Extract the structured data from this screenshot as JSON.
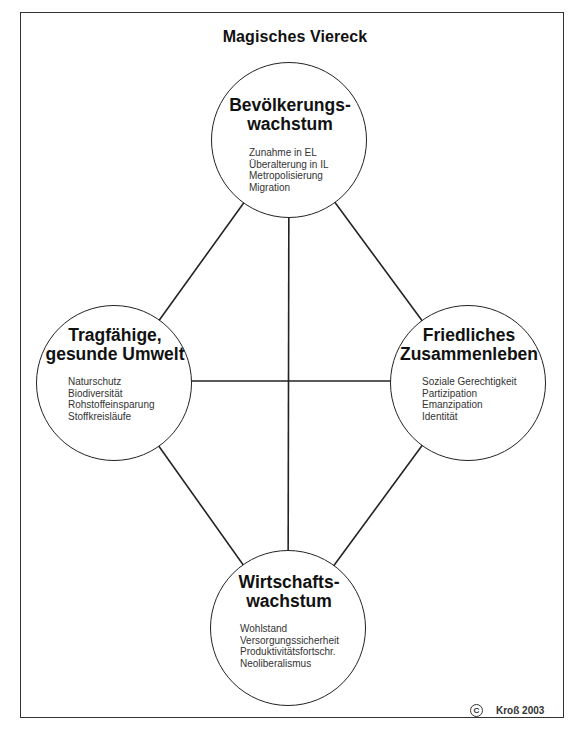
{
  "title": "Magisches Viereck",
  "nodes": {
    "top": {
      "heading": [
        "Bevölkerungs-",
        "wachstum"
      ],
      "items": [
        "Zunahme in EL",
        "Überalterung in IL",
        "Metropolisierung",
        "Migration"
      ]
    },
    "left": {
      "heading": [
        "Tragfähige,",
        "gesunde Umwelt"
      ],
      "items": [
        "Naturschutz",
        "Biodiversität",
        "Rohstoffeinsparung",
        "Stoffkreisläufe"
      ]
    },
    "right": {
      "heading": [
        "Friedliches",
        "Zusammenleben"
      ],
      "items": [
        "Soziale Gerechtigkeit",
        "Partizipation",
        "Emanzipation",
        "Identität"
      ]
    },
    "bottom": {
      "heading": [
        "Wirtschafts-",
        "wachstum"
      ],
      "items": [
        "Wohlstand",
        "Versorgungssicherheit",
        "Produktivitätsfortschr.",
        "Neoliberalismus"
      ]
    }
  },
  "connections": [
    [
      "top",
      "left"
    ],
    [
      "top",
      "right"
    ],
    [
      "top",
      "bottom"
    ],
    [
      "left",
      "right"
    ],
    [
      "left",
      "bottom"
    ],
    [
      "right",
      "bottom"
    ]
  ],
  "copyright": {
    "symbol": "C",
    "text": "Kroß 2003"
  },
  "colors": {
    "line": "#222222",
    "background": "#ffffff",
    "frame": "#333333"
  }
}
